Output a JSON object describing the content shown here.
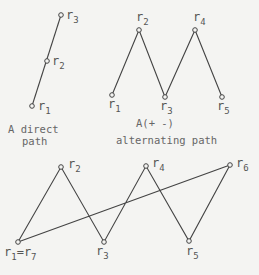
{
  "diagrams": [
    {
      "id": "direct",
      "caption_lines": [
        "A direct",
        "path"
      ],
      "nodes": [
        {
          "label": "r",
          "sub": "1",
          "x": 32,
          "y": 106
        },
        {
          "label": "r",
          "sub": "2",
          "x": 47,
          "y": 61
        },
        {
          "label": "r",
          "sub": "3",
          "x": 61,
          "y": 15
        }
      ]
    },
    {
      "id": "alternating",
      "caption_lines": [
        "A(+ -)",
        "alternating path"
      ],
      "nodes": [
        {
          "label": "r",
          "sub": "1",
          "x": 112,
          "y": 95
        },
        {
          "label": "r",
          "sub": "2",
          "x": 139,
          "y": 30
        },
        {
          "label": "r",
          "sub": "3",
          "x": 165,
          "y": 97
        },
        {
          "label": "r",
          "sub": "4",
          "x": 195,
          "y": 30
        },
        {
          "label": "r",
          "sub": "5",
          "x": 222,
          "y": 97
        }
      ]
    },
    {
      "id": "cycle",
      "caption_lines": [],
      "nodes": [
        {
          "label": "r",
          "sub": "1",
          "extra": "=r",
          "extra_sub": "7",
          "x": 18,
          "y": 242
        },
        {
          "label": "r",
          "sub": "2",
          "x": 61,
          "y": 167
        },
        {
          "label": "r",
          "sub": "3",
          "x": 104,
          "y": 242
        },
        {
          "label": "r",
          "sub": "4",
          "x": 146,
          "y": 166
        },
        {
          "label": "r",
          "sub": "5",
          "x": 189,
          "y": 241
        },
        {
          "label": "r",
          "sub": "6",
          "x": 230,
          "y": 165
        }
      ]
    }
  ],
  "captions": {
    "direct_line1": "A direct",
    "direct_line2": "path",
    "alt_line1": "A(+ -)",
    "alt_line2": "alternating path"
  },
  "labels": {
    "d_r1": "r",
    "d_r1s": "1",
    "d_r2": "r",
    "d_r2s": "2",
    "d_r3": "r",
    "d_r3s": "3",
    "a_r1": "r",
    "a_r1s": "1",
    "a_r2": "r",
    "a_r2s": "2",
    "a_r3": "r",
    "a_r3s": "3",
    "a_r4": "r",
    "a_r4s": "4",
    "a_r5": "r",
    "a_r5s": "5",
    "c_r1": "r",
    "c_r1s": "1",
    "c_eq": "=r",
    "c_r7s": "7",
    "c_r2": "r",
    "c_r2s": "2",
    "c_r3": "r",
    "c_r3s": "3",
    "c_r4": "r",
    "c_r4s": "4",
    "c_r5": "r",
    "c_r5s": "5",
    "c_r6": "r",
    "c_r6s": "6"
  }
}
